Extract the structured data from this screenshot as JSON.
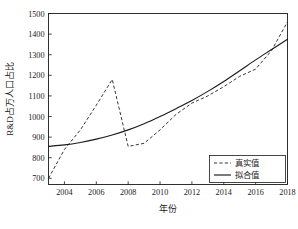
{
  "chart_data": {
    "type": "line",
    "title": "",
    "xlabel": "年份",
    "ylabel": "R&D占万人口占比",
    "xlim": [
      2003,
      2018
    ],
    "ylim": [
      670,
      1500
    ],
    "grid": false,
    "legend_position": "bottom-right",
    "xticks": [
      "2004",
      "2006",
      "2008",
      "2010",
      "2012",
      "2014",
      "2016",
      "2018"
    ],
    "xtick_values": [
      2004,
      2006,
      2008,
      2010,
      2012,
      2014,
      2016,
      2018
    ],
    "yticks": [
      "700",
      "800",
      "900",
      "1000",
      "1100",
      "1200",
      "1300",
      "1400",
      "1500"
    ],
    "ytick_values": [
      700,
      800,
      900,
      1000,
      1100,
      1200,
      1300,
      1400,
      1500
    ],
    "x": [
      2003,
      2004,
      2005,
      2006,
      2007,
      2008,
      2009,
      2010,
      2011,
      2012,
      2013,
      2014,
      2015,
      2016,
      2017,
      2018
    ],
    "series": [
      {
        "name": "真实值",
        "style": "dashed",
        "color": "#2b2b2b",
        "values": [
          700,
          840,
          935,
          1055,
          1180,
          855,
          870,
          935,
          1010,
          1065,
          1100,
          1145,
          1195,
          1230,
          1320,
          1460
        ]
      },
      {
        "name": "拟合值",
        "style": "solid",
        "color": "#1a1a1a",
        "values": [
          855,
          862,
          874,
          890,
          910,
          935,
          965,
          1000,
          1038,
          1078,
          1122,
          1170,
          1222,
          1275,
          1325,
          1375
        ]
      }
    ]
  },
  "legend": {
    "entries": [
      {
        "label": "真实值",
        "style": "dashed"
      },
      {
        "label": "拟合值",
        "style": "solid"
      }
    ]
  }
}
